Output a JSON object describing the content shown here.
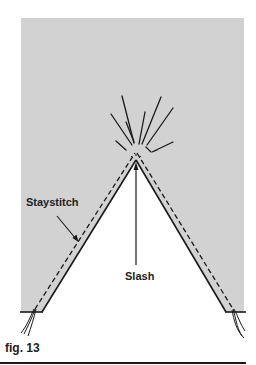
{
  "figure": {
    "number_label": "fig. 13",
    "labels": {
      "staystitch": "Staystitch",
      "slash": "Slash"
    },
    "colors": {
      "fabric_gray": "#d2d2d2",
      "background": "#ffffff",
      "ink": "#1a1a1a"
    },
    "geometry": {
      "fabric_panel": {
        "x": 21,
        "y": 18,
        "width": 223,
        "height": 294
      },
      "v_cut": {
        "apex": [
          136,
          160
        ],
        "base_left": [
          42,
          311
        ],
        "base_right": [
          226,
          311
        ]
      }
    }
  }
}
